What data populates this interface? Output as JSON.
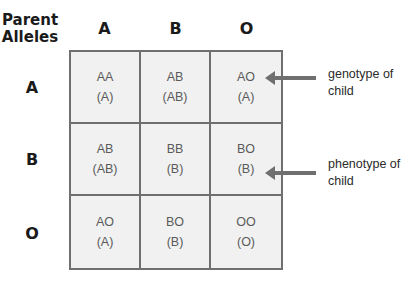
{
  "corner_label": "Parent Alleles",
  "column_headers": [
    "A",
    "B",
    "O"
  ],
  "row_headers": [
    "A",
    "B",
    "O"
  ],
  "cells": [
    [
      {
        "genotype": "AA",
        "phenotype": "(A)"
      },
      {
        "genotype": "AB",
        "phenotype": "(AB)"
      },
      {
        "genotype": "AO",
        "phenotype": "(A)"
      }
    ],
    [
      {
        "genotype": "AB",
        "phenotype": "(AB)"
      },
      {
        "genotype": "BB",
        "phenotype": "(B)"
      },
      {
        "genotype": "BO",
        "phenotype": "(B)"
      }
    ],
    [
      {
        "genotype": "AO",
        "phenotype": "(A)"
      },
      {
        "genotype": "BO",
        "phenotype": "(B)"
      },
      {
        "genotype": "OO",
        "phenotype": "(O)"
      }
    ]
  ],
  "annotations": {
    "genotype": "genotype of child",
    "phenotype": "phenotype of child"
  },
  "colors": {
    "grid_line": "#6f6f6f",
    "cell_fill": "#f1f1f1",
    "arrow": "#6f6f6f"
  }
}
